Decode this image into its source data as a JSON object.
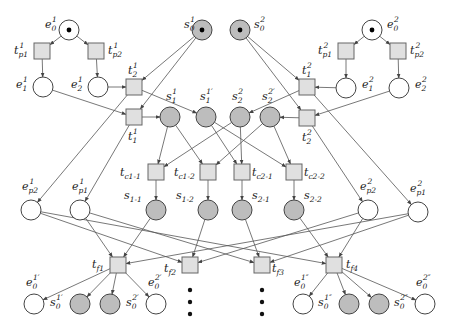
{
  "diagram": {
    "type": "petri-net",
    "colors": {
      "shared_place_fill": "#bdbdbd",
      "local_place_fill": "#ffffff",
      "transition_fill": "#e0e0e0",
      "stroke": "#444444",
      "token": "#000000"
    },
    "places": [
      {
        "id": "s0_1",
        "label": "s",
        "sub": "0",
        "sup": "1",
        "x": 202,
        "y": 30,
        "shared": true,
        "token": true,
        "lx": 184,
        "ly": 28
      },
      {
        "id": "s0_2",
        "label": "s",
        "sub": "0",
        "sup": "2",
        "x": 240,
        "y": 30,
        "shared": true,
        "token": true,
        "lx": 254,
        "ly": 28
      },
      {
        "id": "e0_1",
        "label": "e",
        "sub": "0",
        "sup": "1",
        "x": 69,
        "y": 30,
        "shared": false,
        "token": true,
        "lx": 45,
        "ly": 28
      },
      {
        "id": "e1_1",
        "label": "e",
        "sub": "1",
        "sup": "1",
        "x": 43,
        "y": 87,
        "shared": false,
        "token": false,
        "lx": 16,
        "ly": 88
      },
      {
        "id": "e2_1",
        "label": "e",
        "sub": "2",
        "sup": "1",
        "x": 98,
        "y": 87,
        "shared": false,
        "token": false,
        "lx": 71,
        "ly": 88
      },
      {
        "id": "e0_2",
        "label": "e",
        "sub": "0",
        "sup": "2",
        "x": 372,
        "y": 30,
        "shared": false,
        "token": true,
        "lx": 387,
        "ly": 28
      },
      {
        "id": "e1_2",
        "label": "e",
        "sub": "1",
        "sup": "2",
        "x": 346,
        "y": 88,
        "shared": false,
        "token": false,
        "lx": 362,
        "ly": 88
      },
      {
        "id": "e2_2",
        "label": "e",
        "sub": "2",
        "sup": "2",
        "x": 399,
        "y": 88,
        "shared": false,
        "token": false,
        "lx": 415,
        "ly": 88
      },
      {
        "id": "s1_1",
        "label": "s",
        "sub": "1",
        "sup": "1",
        "x": 170,
        "y": 117,
        "shared": true,
        "token": false,
        "lx": 166,
        "ly": 100
      },
      {
        "id": "s1_1p",
        "label": "s",
        "sub": "1",
        "sup": "1′",
        "x": 206,
        "y": 117,
        "shared": true,
        "token": false,
        "lx": 200,
        "ly": 100
      },
      {
        "id": "s2_2",
        "label": "s",
        "sub": "2",
        "sup": "2",
        "x": 240,
        "y": 117,
        "shared": true,
        "token": false,
        "lx": 232,
        "ly": 100
      },
      {
        "id": "s2_2p",
        "label": "s",
        "sub": "2",
        "sup": "2′",
        "x": 270,
        "y": 117,
        "shared": true,
        "token": false,
        "lx": 262,
        "ly": 100
      },
      {
        "id": "s1-1",
        "label": "s",
        "sub": "1-1",
        "sup": "",
        "x": 156,
        "y": 210,
        "shared": true,
        "token": false,
        "lx": 124,
        "ly": 199
      },
      {
        "id": "s1-2",
        "label": "s",
        "sub": "1-2",
        "sup": "",
        "x": 208,
        "y": 210,
        "shared": true,
        "token": false,
        "lx": 176,
        "ly": 199
      },
      {
        "id": "s2-1",
        "label": "s",
        "sub": "2-1",
        "sup": "",
        "x": 242,
        "y": 210,
        "shared": true,
        "token": false,
        "lx": 252,
        "ly": 199
      },
      {
        "id": "s2-2",
        "label": "s",
        "sub": "2-2",
        "sup": "",
        "x": 294,
        "y": 210,
        "shared": true,
        "token": false,
        "lx": 304,
        "ly": 199
      },
      {
        "id": "ep2_1",
        "label": "e",
        "sub": "p2",
        "sup": "1",
        "x": 31,
        "y": 210,
        "shared": false,
        "token": false,
        "lx": 22,
        "ly": 190
      },
      {
        "id": "ep1_1",
        "label": "e",
        "sub": "p1",
        "sup": "1",
        "x": 80,
        "y": 210,
        "shared": false,
        "token": false,
        "lx": 72,
        "ly": 190
      },
      {
        "id": "ep2_2",
        "label": "e",
        "sub": "p2",
        "sup": "2",
        "x": 368,
        "y": 210,
        "shared": false,
        "token": false,
        "lx": 360,
        "ly": 190
      },
      {
        "id": "ep1_2",
        "label": "e",
        "sub": "p1",
        "sup": "2",
        "x": 418,
        "y": 212,
        "shared": false,
        "token": false,
        "lx": 410,
        "ly": 192
      },
      {
        "id": "e0_1p",
        "label": "e",
        "sub": "0",
        "sup": "1′",
        "x": 34,
        "y": 304,
        "shared": false,
        "token": false,
        "lx": 26,
        "ly": 286
      },
      {
        "id": "s0_1p",
        "label": "s",
        "sub": "0",
        "sup": "1′",
        "x": 80,
        "y": 304,
        "shared": true,
        "token": false,
        "lx": 50,
        "ly": 306
      },
      {
        "id": "s0_2p",
        "label": "s",
        "sub": "0",
        "sup": "2′",
        "x": 110,
        "y": 304,
        "shared": true,
        "token": false,
        "lx": 126,
        "ly": 306
      },
      {
        "id": "e0_2p",
        "label": "e",
        "sub": "0",
        "sup": "2′",
        "x": 156,
        "y": 304,
        "shared": false,
        "token": false,
        "lx": 148,
        "ly": 286
      },
      {
        "id": "e0_1pp",
        "label": "e",
        "sub": "0",
        "sup": "1″",
        "x": 303,
        "y": 304,
        "shared": false,
        "token": false,
        "lx": 294,
        "ly": 286
      },
      {
        "id": "s0_1pp",
        "label": "s",
        "sub": "0",
        "sup": "1″",
        "x": 349,
        "y": 304,
        "shared": true,
        "token": false,
        "lx": 318,
        "ly": 306
      },
      {
        "id": "s0_2pp",
        "label": "s",
        "sub": "0",
        "sup": "2″",
        "x": 379,
        "y": 304,
        "shared": true,
        "token": false,
        "lx": 394,
        "ly": 306
      },
      {
        "id": "e0_2pp",
        "label": "e",
        "sub": "0",
        "sup": "2″",
        "x": 425,
        "y": 304,
        "shared": false,
        "token": false,
        "lx": 416,
        "ly": 286
      }
    ],
    "transitions": [
      {
        "id": "tp1_1",
        "label": "t",
        "sub": "p1",
        "sup": "1",
        "x": 42,
        "y": 51,
        "lx": 14,
        "ly": 54
      },
      {
        "id": "tp2_1",
        "label": "t",
        "sub": "p2",
        "sup": "1",
        "x": 96,
        "y": 51,
        "lx": 108,
        "ly": 54
      },
      {
        "id": "t2_1",
        "label": "t",
        "sub": "2",
        "sup": "1",
        "x": 134,
        "y": 87,
        "lx": 128,
        "ly": 74
      },
      {
        "id": "t1_1",
        "label": "t",
        "sub": "1",
        "sup": "1",
        "x": 134,
        "y": 117,
        "lx": 128,
        "ly": 140
      },
      {
        "id": "tp1_2",
        "label": "t",
        "sub": "p1",
        "sup": "2",
        "x": 346,
        "y": 51,
        "lx": 318,
        "ly": 54
      },
      {
        "id": "tp2_2",
        "label": "t",
        "sub": "p2",
        "sup": "2",
        "x": 398,
        "y": 51,
        "lx": 410,
        "ly": 54
      },
      {
        "id": "t1_2",
        "label": "t",
        "sub": "1",
        "sup": "2",
        "x": 307,
        "y": 87,
        "lx": 302,
        "ly": 74
      },
      {
        "id": "t2_2",
        "label": "t",
        "sub": "2",
        "sup": "2",
        "x": 307,
        "y": 118,
        "lx": 302,
        "ly": 141
      },
      {
        "id": "tc1-1",
        "label": "t",
        "sub": "c1-1",
        "sup": "",
        "x": 156,
        "y": 172,
        "lx": 120,
        "ly": 176
      },
      {
        "id": "tc1-2",
        "label": "t",
        "sub": "c1-2",
        "sup": "",
        "x": 208,
        "y": 172,
        "lx": 174,
        "ly": 176
      },
      {
        "id": "tc2-1",
        "label": "t",
        "sub": "c2-1",
        "sup": "",
        "x": 242,
        "y": 172,
        "lx": 252,
        "ly": 176
      },
      {
        "id": "tc2-2",
        "label": "t",
        "sub": "c2-2",
        "sup": "",
        "x": 294,
        "y": 172,
        "lx": 304,
        "ly": 176
      },
      {
        "id": "tf1",
        "label": "t",
        "sub": "f1",
        "sup": "",
        "x": 118,
        "y": 265,
        "lx": 92,
        "ly": 268
      },
      {
        "id": "tf2",
        "label": "t",
        "sub": "f2",
        "sup": "",
        "x": 190,
        "y": 265,
        "lx": 164,
        "ly": 272
      },
      {
        "id": "tf3",
        "label": "t",
        "sub": "f3",
        "sup": "",
        "x": 262,
        "y": 265,
        "lx": 272,
        "ly": 272
      },
      {
        "id": "tf4",
        "label": "t",
        "sub": "f4",
        "sup": "",
        "x": 334,
        "y": 265,
        "lx": 346,
        "ly": 268
      }
    ],
    "arcs": [
      [
        "e0_1",
        "tp1_1"
      ],
      [
        "e0_1",
        "tp2_1"
      ],
      [
        "tp1_1",
        "e1_1"
      ],
      [
        "tp2_1",
        "e2_1"
      ],
      [
        "e2_1",
        "t2_1"
      ],
      [
        "e1_1",
        "t1_1"
      ],
      [
        "s0_1",
        "t2_1"
      ],
      [
        "s0_1",
        "t1_1"
      ],
      [
        "t1_1",
        "s1_1"
      ],
      [
        "t2_1",
        "s1_1p"
      ],
      [
        "e0_2",
        "tp1_2"
      ],
      [
        "e0_2",
        "tp2_2"
      ],
      [
        "tp1_2",
        "e1_2"
      ],
      [
        "tp2_2",
        "e2_2"
      ],
      [
        "e1_2",
        "t1_2"
      ],
      [
        "e2_2",
        "t2_2"
      ],
      [
        "s0_2",
        "t1_2"
      ],
      [
        "s0_2",
        "t2_2"
      ],
      [
        "t1_2",
        "s2_2"
      ],
      [
        "t2_2",
        "s2_2p"
      ],
      [
        "s1_1",
        "tc1-1"
      ],
      [
        "s1_1",
        "tc1-2"
      ],
      [
        "s1_1p",
        "tc2-1"
      ],
      [
        "s1_1p",
        "tc2-2"
      ],
      [
        "s2_2",
        "tc1-1"
      ],
      [
        "s2_2",
        "tc2-1"
      ],
      [
        "s2_2p",
        "tc1-2"
      ],
      [
        "s2_2p",
        "tc2-2"
      ],
      [
        "tc1-1",
        "s1-1"
      ],
      [
        "tc1-2",
        "s1-2"
      ],
      [
        "tc2-1",
        "s2-1"
      ],
      [
        "tc2-2",
        "s2-2"
      ],
      [
        "t2_1",
        "ep2_1"
      ],
      [
        "t1_1",
        "ep1_1"
      ],
      [
        "t1_2",
        "ep1_2"
      ],
      [
        "t2_2",
        "ep2_2"
      ],
      [
        "ep1_1",
        "tf1"
      ],
      [
        "s1-1",
        "tf1"
      ],
      [
        "ep1_2",
        "tf1"
      ],
      [
        "ep2_1",
        "tf2"
      ],
      [
        "s1-2",
        "tf2"
      ],
      [
        "ep2_2",
        "tf2"
      ],
      [
        "ep1_1",
        "tf3"
      ],
      [
        "s2-1",
        "tf3"
      ],
      [
        "ep1_2",
        "tf3"
      ],
      [
        "ep2_1",
        "tf4"
      ],
      [
        "s2-2",
        "tf4"
      ],
      [
        "ep2_2",
        "tf4"
      ],
      [
        "tf1",
        "e0_1p"
      ],
      [
        "tf1",
        "s0_1p"
      ],
      [
        "tf1",
        "s0_2p"
      ],
      [
        "tf1",
        "e0_2p"
      ],
      [
        "tf4",
        "e0_1pp"
      ],
      [
        "tf4",
        "s0_1pp"
      ],
      [
        "tf4",
        "s0_2pp"
      ],
      [
        "tf4",
        "e0_2pp"
      ]
    ],
    "ellipses": [
      {
        "x": 190,
        "y": 290
      },
      {
        "x": 190,
        "y": 302
      },
      {
        "x": 190,
        "y": 314
      },
      {
        "x": 262,
        "y": 290
      },
      {
        "x": 262,
        "y": 302
      },
      {
        "x": 262,
        "y": 314
      }
    ]
  }
}
